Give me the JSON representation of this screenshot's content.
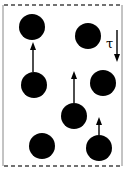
{
  "diagram": {
    "width": 126,
    "height": 177,
    "colors": {
      "ink": "#000000",
      "wall": "#888888",
      "background": "#ffffff"
    },
    "top_boundary": {
      "y": 5,
      "x1": 4,
      "x2": 122,
      "style": "dashed"
    },
    "bottom_boundary": {
      "y": 166,
      "x1": 4,
      "x2": 122,
      "style": "dashed"
    },
    "left_wall": {
      "x": 3,
      "y1": 5,
      "y2": 166
    },
    "right_wall": {
      "x": 122,
      "y1": 5,
      "y2": 166
    },
    "shear_label": {
      "symbol": "τ",
      "x": 110,
      "y": 48
    },
    "shear_arrow": {
      "x": 117,
      "y1": 30,
      "y2": 62,
      "direction": "down"
    },
    "particles": [
      {
        "id": 1,
        "cx": 32,
        "cy": 27,
        "r": 13,
        "arrow": null
      },
      {
        "id": 2,
        "cx": 88,
        "cy": 36,
        "r": 13,
        "arrow": null
      },
      {
        "id": 3,
        "cx": 34,
        "cy": 85,
        "r": 13,
        "arrow": {
          "x": 33,
          "from_y": 72,
          "to_y": 42
        }
      },
      {
        "id": 4,
        "cx": 103,
        "cy": 83,
        "r": 13,
        "arrow": null
      },
      {
        "id": 5,
        "cx": 74,
        "cy": 116,
        "r": 13,
        "arrow": {
          "x": 74,
          "from_y": 103,
          "to_y": 71
        }
      },
      {
        "id": 6,
        "cx": 42,
        "cy": 146,
        "r": 13,
        "arrow": null
      },
      {
        "id": 7,
        "cx": 99,
        "cy": 148,
        "r": 13,
        "arrow": {
          "x": 99,
          "from_y": 135,
          "to_y": 117
        }
      }
    ]
  }
}
